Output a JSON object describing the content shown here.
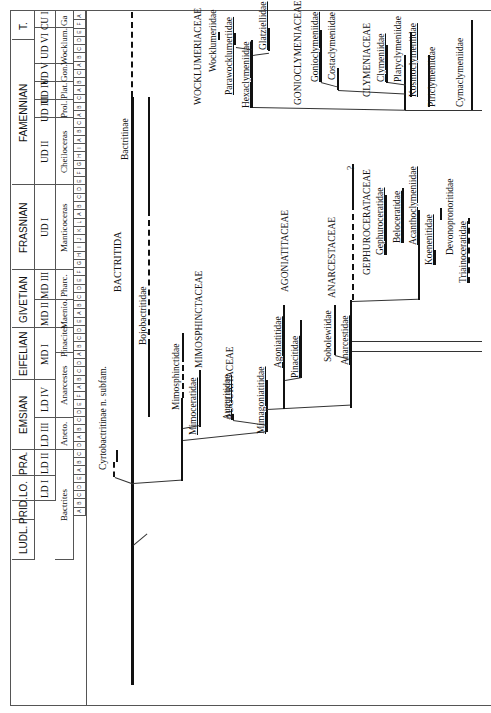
{
  "stages": [
    {
      "label": "T.",
      "y0": 12,
      "y1": 40
    },
    {
      "label": "FAMENNIAN",
      "y0": 40,
      "y1": 185
    },
    {
      "label": "FRASNIAN",
      "y0": 185,
      "y1": 270
    },
    {
      "label": "GIVETIAN",
      "y0": 270,
      "y1": 328
    },
    {
      "label": "EIFELIAN",
      "y0": 328,
      "y1": 380
    },
    {
      "label": "EMSIAN",
      "y0": 380,
      "y1": 450
    },
    {
      "label": "PRA.",
      "y0": 450,
      "y1": 476
    },
    {
      "label": "LO.",
      "y0": 476,
      "y1": 501
    },
    {
      "label": "PRID.",
      "y0": 501,
      "y1": 520
    },
    {
      "label": "LUDL.",
      "y0": 520,
      "y1": 560
    }
  ],
  "substages": [
    {
      "label": "CU I",
      "y0": 12,
      "y1": 28
    },
    {
      "label": "UD VI",
      "y0": 28,
      "y1": 64
    },
    {
      "label": "UD V",
      "y0": 64,
      "y1": 82
    },
    {
      "label": "UD IV",
      "y0": 82,
      "y1": 100
    },
    {
      "label": "UD III",
      "y0": 100,
      "y1": 118
    },
    {
      "label": "UD II",
      "y0": 118,
      "y1": 185
    },
    {
      "label": "UD I",
      "y0": 185,
      "y1": 270
    },
    {
      "label": "MD III",
      "y0": 270,
      "y1": 300
    },
    {
      "label": "MD II",
      "y0": 300,
      "y1": 328
    },
    {
      "label": "MD I",
      "y0": 328,
      "y1": 380
    },
    {
      "label": "LD IV",
      "y0": 380,
      "y1": 418
    },
    {
      "label": "LD III",
      "y0": 418,
      "y1": 450
    },
    {
      "label": "LD II",
      "y0": 450,
      "y1": 476
    },
    {
      "label": "LD I",
      "y0": 476,
      "y1": 501
    }
  ],
  "zones": [
    {
      "label": "Ga",
      "y0": 12,
      "y1": 28
    },
    {
      "label": "Wocklum.",
      "y0": 28,
      "y1": 64
    },
    {
      "label": "Gon.",
      "y0": 64,
      "y1": 82
    },
    {
      "label": "Plat.",
      "y0": 82,
      "y1": 100
    },
    {
      "label": "Prol.",
      "y0": 100,
      "y1": 118
    },
    {
      "label": "Cheiloceras",
      "y0": 118,
      "y1": 185
    },
    {
      "label": "Manticoceras",
      "y0": 185,
      "y1": 270
    },
    {
      "label": "Pharc.",
      "y0": 270,
      "y1": 300
    },
    {
      "label": "Maenio.",
      "y0": 300,
      "y1": 328
    },
    {
      "label": "Pinacites",
      "y0": 328,
      "y1": 353
    },
    {
      "label": "Anarcestes",
      "y0": 353,
      "y1": 418
    },
    {
      "label": "Aneto.",
      "y0": 418,
      "y1": 450
    },
    {
      "label": "Bactrites",
      "y0": 450,
      "y1": 560
    }
  ],
  "subzone_letters": "A F E D C B A C B A C B A C B A I H G F E D C B A L K J I H G F E D C B A E D C B A D C B A F E D C B A D C B A E D C B A",
  "taxa": {
    "order": "BACTRITIDA",
    "bactritinae": "Bactritinae",
    "bojobactritidae": "Bojobactritidae",
    "cyrtobactritinae": "Cyrtobactritinae n. subfam.",
    "mimosphinctaceae": "MIMOSPHINCTACEAE",
    "mimosphinctidae": "Mimosphinctidae",
    "mimoceratidae": "Mimoceratidae",
    "auguritaceae": "AUGURITACEAE",
    "auguritidae": "Auguritidae",
    "mimagoniatitidae": "Mimagoniatitidae",
    "agoniatitaceae": "AGONIATITACEAE",
    "agoniatitidae": "Agoniatitidae",
    "pinacitidae": "Pinacitidae",
    "anarcestaceae": "ANARCESTACEAE",
    "sobolewiidae": "Sobolewiidae",
    "anarcestidae": "Anarcestidae",
    "gephuroceratacee": "GEPHUROCERATACEAE",
    "gephuroceratidae": "Gephuroceratidae",
    "beloceratidae": "Beloceratidae",
    "acanthoclymeniidae": "Acanthoclymeniidae",
    "koenenitidae": "Koenenitidae",
    "devonopronoritidae": "Devonopronoritidae",
    "triainoceratidae": "Triainoceratidae",
    "question": "?",
    "wocklumeriaceae": "WOCKLUMERIACEAE",
    "wocklumeriidae": "Wocklumeriidae",
    "parawocklumeriidae": "Parawocklumeriidae",
    "hexaclymeniidae": "Hexaclymeniidae",
    "glatziellidae": "Glatziellidae",
    "gonioclymeniaceae": "GONIOCLYMENIACEAE",
    "gonioclymeniidae": "Gonioclymeniidae",
    "costaclymeniidae": "Costaclymeniidae",
    "clymeniaceae": "CLYMENIACEAE",
    "clymeniidae": "Clymeniidae",
    "platyclymeniidae": "Platyclymeniidae",
    "kosmoclymeniidae": "Kosmoclymeniidae",
    "piriclymeniidae": "Piriclymeniidae",
    "cymaclymeniidae": "Cymaclymeniidae"
  }
}
